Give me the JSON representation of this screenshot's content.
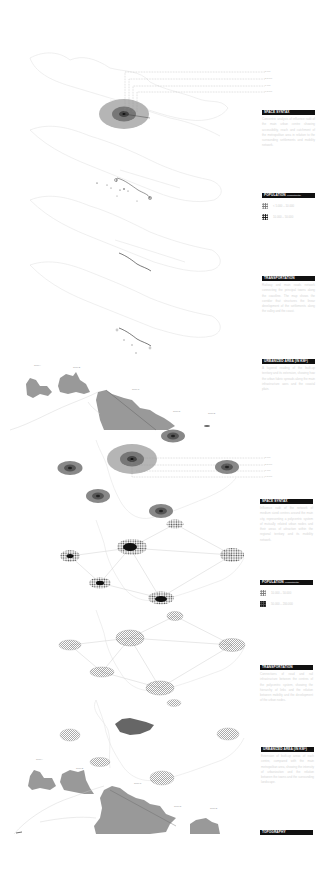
{
  "diagram": {
    "colors": {
      "background": "#ffffff",
      "outline": "#e2e2e2",
      "ring_outer": "#a9a9a9",
      "ring_middle": "#6e6e6e",
      "ring_inner": "#3a3a3a",
      "urban_fill": "#9a9a9a",
      "label_bar": "#111111",
      "body_text": "#d6d6d6"
    }
  },
  "top_group": {
    "distance_labels": [
      "5 KM",
      "2,5 KM",
      "1 KM",
      "0,5 KM"
    ],
    "sections": [
      {
        "title": "SPACE SYNTAX",
        "subtitle": "",
        "text": "Concentric analysis of influence radii of the main urban centre showing accessibility, reach and catchment of the metropolitan area in relation to the surrounding settlements and mobility network."
      },
      {
        "title": "POPULATION",
        "subtitle": "(inhabitants)",
        "swatches": [
          {
            "style": "light",
            "label": "< 5.000 – 10.000"
          },
          {
            "style": "dark-light",
            "label": "10.000 – 50.000"
          }
        ]
      },
      {
        "title": "TRANSPORTATION",
        "subtitle": "",
        "text": "Railway and main roads network connecting the principal towns along the coastline. The map shows the corridor that structures the linear development of the settlements along the valley and the coast."
      },
      {
        "title": "URBANIZED AREA (IN KM²)",
        "subtitle": "",
        "text": "A layered reading of the built-up territory and its extension, showing how the urban fabric spreads along the main infrastructure axes and the coastal plain."
      }
    ]
  },
  "bottom_group": {
    "distance_labels": [
      "5 KM",
      "2,5 KM",
      "1 KM",
      "0,5 KM"
    ],
    "sections": [
      {
        "title": "SPACE SYNTAX",
        "subtitle": "",
        "text": "Influence radii of the network of medium sized centres around the main city, representing a polycentric system of mutually related urban nodes and their areas of attraction within the regional territory and its mobility network."
      },
      {
        "title": "POPULATION",
        "subtitle": "(inhabitants)",
        "swatches": [
          {
            "style": "light",
            "label": "10.000 – 50.000"
          },
          {
            "style": "dark",
            "label": "50.000 – 200.000"
          }
        ]
      },
      {
        "title": "TRANSPORTATION",
        "subtitle": "",
        "text": "Connections of road and rail infrastructure between the centres of the polycentric system, showing the hierarchy of links and the relation between mobility and the development of the urban nodes."
      },
      {
        "title": "URBANIZED AREA (IN KM²)",
        "subtitle": "",
        "text": "Extension of built-up areas of each centre, compared with the main metropolitan area, showing the intensity of urbanization and the relation between the towns and the surrounding landscape."
      },
      {
        "title": "TOPOGRAPHY",
        "subtitle": "",
        "text": ""
      }
    ]
  },
  "map_labels": {
    "top_map": [
      "Town A",
      "Town B",
      "Town C",
      "Town D",
      "Town E"
    ],
    "bottom_map": [
      "Town A",
      "Town B",
      "Town C",
      "Town D",
      "Town E"
    ]
  }
}
